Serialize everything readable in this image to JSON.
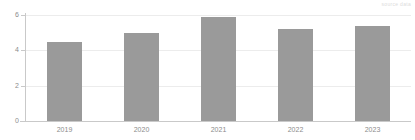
{
  "watermark": {
    "text": "source data"
  },
  "chart_data": {
    "type": "bar",
    "title": "",
    "subtitle": "",
    "xlabel": "",
    "ylabel": "",
    "categories": [
      "2019",
      "2020",
      "2021",
      "2022",
      "2023"
    ],
    "values": [
      4.5,
      5.0,
      5.9,
      5.2,
      5.4
    ],
    "series": [
      {
        "name": "",
        "values": [
          4.5,
          5.0,
          5.9,
          5.2,
          5.4
        ],
        "color": "#9a9a9a"
      }
    ],
    "ylim": [
      0,
      6
    ],
    "yticks": [
      0,
      2,
      4,
      6
    ],
    "ytick_labels": [
      "0",
      "2",
      "4",
      "6"
    ],
    "grid": true,
    "grid_axis": "y",
    "grid_color": "#ececec",
    "axis_color": "#c9c9c9",
    "legend": false,
    "legend_position": "none",
    "annotations": [],
    "bar_color": "#9a9a9a",
    "background": "#ffffff"
  }
}
